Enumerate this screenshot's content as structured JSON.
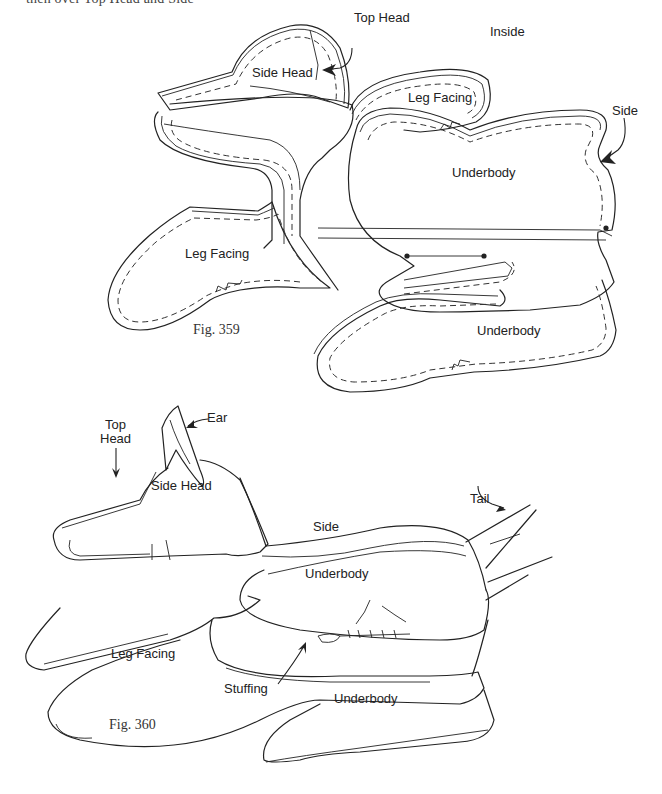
{
  "page": {
    "cut_text": "then over Top Head and Side"
  },
  "figure_359": {
    "caption": "Fig. 359",
    "labels": {
      "top_head": "Top Head",
      "inside": "Inside",
      "side_head": "Side Head",
      "leg_facing_upper": "Leg Facing",
      "side": "Side",
      "underbody_upper": "Underbody",
      "leg_facing_lower": "Leg Facing",
      "underbody_lower": "Underbody"
    }
  },
  "figure_360": {
    "caption": "Fig. 360",
    "labels": {
      "ear": "Ear",
      "top_head": "Top\nHead",
      "top_head_line1": "Top",
      "top_head_line2": "Head",
      "side_head": "Side Head",
      "tail": "Tail",
      "side": "Side",
      "underbody_upper": "Underbody",
      "leg_facing": "Leg Facing",
      "stuffing": "Stuffing",
      "underbody_lower": "Underbody"
    }
  }
}
